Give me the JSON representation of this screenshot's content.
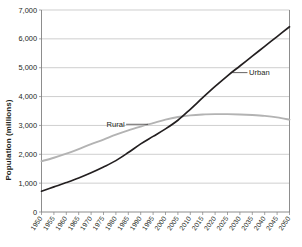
{
  "chart_data": {
    "type": "line",
    "title": "",
    "xlabel": "",
    "ylabel": "Population (millions)",
    "ylim": [
      0,
      7000
    ],
    "ytick_labels": [
      "0",
      "1,000",
      "2,000",
      "3,000",
      "4,000",
      "5,000",
      "6,000",
      "7,000"
    ],
    "ytick_values": [
      0,
      1000,
      2000,
      3000,
      4000,
      5000,
      6000,
      7000
    ],
    "grid": true,
    "legend_position": "inline-annotations",
    "x": [
      1950,
      1955,
      1960,
      1965,
      1970,
      1975,
      1980,
      1985,
      1990,
      1995,
      2000,
      2005,
      2010,
      2015,
      2020,
      2025,
      2030,
      2035,
      2040,
      2045,
      2050
    ],
    "categories": [
      "1950",
      "1955",
      "1960",
      "1965",
      "1970",
      "1975",
      "1980",
      "1985",
      "1990",
      "1995",
      "2000",
      "2005",
      "2010",
      "2015",
      "2020",
      "2025",
      "2030",
      "2035",
      "2040",
      "2045",
      "2050"
    ],
    "series": [
      {
        "name": "Urban",
        "color": "#231f20",
        "values": [
          720,
          870,
          1020,
          1180,
          1360,
          1560,
          1780,
          2060,
          2360,
          2620,
          2880,
          3180,
          3560,
          3960,
          4350,
          4720,
          5060,
          5400,
          5740,
          6080,
          6420
        ]
      },
      {
        "name": "Rural",
        "color": "#b3b3b3",
        "values": [
          1760,
          1880,
          2020,
          2180,
          2350,
          2510,
          2680,
          2830,
          2960,
          3080,
          3200,
          3290,
          3350,
          3380,
          3390,
          3390,
          3380,
          3360,
          3330,
          3280,
          3200
        ]
      }
    ],
    "annotations": [
      {
        "text": "Urban",
        "series": "Urban",
        "anchor_year": 2027,
        "anchor_value": 4830
      },
      {
        "text": "Rural",
        "series": "Rural",
        "anchor_year": 1993,
        "anchor_value": 3040
      }
    ]
  }
}
